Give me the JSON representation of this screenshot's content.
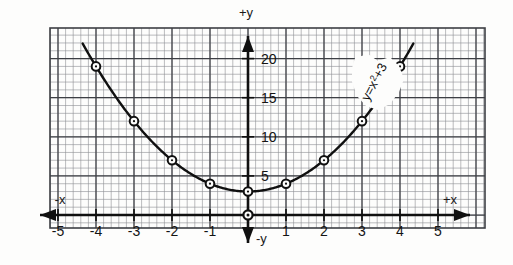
{
  "figure": {
    "name": "parabola-graph",
    "paper_color": "#fdfdfc",
    "grid_minor_color": "#8d8f93",
    "grid_major_color": "#3d3f44",
    "ink_color": "#101010"
  },
  "axes": {
    "x_positive_label": "+x",
    "x_negative_label": "-x",
    "y_positive_label": "+y",
    "y_negative_label": "-y",
    "x_ticks": [
      {
        "label": "-5",
        "value": -5
      },
      {
        "label": "-4",
        "value": -4
      },
      {
        "label": "-3",
        "value": -3
      },
      {
        "label": "-2",
        "value": -2
      },
      {
        "label": "-1",
        "value": -1
      },
      {
        "label": "1",
        "value": 1
      },
      {
        "label": "2",
        "value": 2
      },
      {
        "label": "3",
        "value": 3
      },
      {
        "label": "4",
        "value": 4
      },
      {
        "label": "5",
        "value": 5
      }
    ],
    "y_ticks": [
      {
        "label": "5",
        "value": 5
      },
      {
        "label": "10",
        "value": 10
      },
      {
        "label": "15",
        "value": 15
      },
      {
        "label": "20",
        "value": 20
      }
    ]
  },
  "annotation": {
    "equation_label": "y=x²+3",
    "equation_base": "y=x",
    "equation_exponent": "2",
    "equation_tail": "+3",
    "rotation_degrees": -62
  },
  "chart_data": {
    "type": "line",
    "title": "",
    "subtitle": "",
    "xlabel": "+x",
    "ylabel": "+y",
    "equation": "y=x^2+3",
    "grid": true,
    "legend_position": "none",
    "xlim": [
      -6.1,
      6.2
    ],
    "ylim": [
      -1.7,
      24.4
    ],
    "xticks": [
      -5,
      -4,
      -3,
      -2,
      -1,
      1,
      2,
      3,
      4,
      5
    ],
    "yticks": [
      5,
      10,
      15,
      20
    ],
    "minor_grid_step": 0.2,
    "major_grid_step": 1,
    "series": [
      {
        "name": "y=x²+3",
        "marker": "open-circle",
        "x": [
          -4,
          -3,
          -2,
          -1,
          0,
          1,
          2,
          3,
          4
        ],
        "values": [
          19,
          12,
          7,
          4,
          3,
          4,
          7,
          12,
          19
        ]
      }
    ],
    "curve_domain": [
      -4.35,
      4.35
    ],
    "annotations": [
      {
        "text": "y=x²+3",
        "x": 2.55,
        "y": 13.5,
        "rotation": -62
      }
    ],
    "special_points": [
      {
        "name": "vertex",
        "x": 0,
        "y": 3
      },
      {
        "name": "origin",
        "x": 0,
        "y": 0
      }
    ]
  }
}
